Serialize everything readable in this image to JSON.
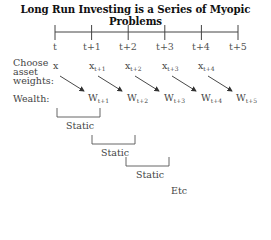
{
  "title": "Long Run Investing is a Series of Myopic Problems",
  "timeline": {
    "ticks": [
      "t",
      "t+1",
      "t+2",
      "t+3",
      "t+4",
      "t+5"
    ]
  },
  "rows": {
    "choose_line1": "Choose",
    "choose_line2": "asset",
    "choose_line3": "weights:",
    "wealth": "Wealth:"
  },
  "weights": [
    {
      "base": "x",
      "sub": ""
    },
    {
      "base": "x",
      "sub": "t+1"
    },
    {
      "base": "x",
      "sub": "t+2"
    },
    {
      "base": "x",
      "sub": "t+3"
    },
    {
      "base": "x",
      "sub": "t+4"
    }
  ],
  "wealth": [
    {
      "base": "W",
      "sub": "t+1"
    },
    {
      "base": "W",
      "sub": "t+2"
    },
    {
      "base": "W",
      "sub": "t+3"
    },
    {
      "base": "W",
      "sub": "t+4"
    },
    {
      "base": "W",
      "sub": "t+5"
    }
  ],
  "brackets": [
    {
      "label": "Static"
    },
    {
      "label": "Static"
    },
    {
      "label": "Static"
    }
  ],
  "etc": "Etc"
}
